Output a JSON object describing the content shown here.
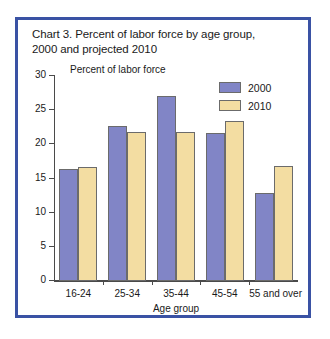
{
  "chart_data": {
    "type": "bar",
    "title": "Chart 3. Percent of labor force by age group, 2000 and projected 2010",
    "title_line1": "Chart 3. Percent of labor force by age group,",
    "title_line2": "2000 and projected 2010",
    "ylabel": "Percent of labor force",
    "xlabel": "Age group",
    "categories": [
      "16-24",
      "25-34",
      "35-44",
      "45-54",
      "55 and over"
    ],
    "series": [
      {
        "name": "2000",
        "color": "#8185c6",
        "values": [
          16.2,
          22.5,
          26.9,
          21.5,
          12.8
        ]
      },
      {
        "name": "2010",
        "color": "#f3dda2",
        "values": [
          16.5,
          21.6,
          21.6,
          23.2,
          16.7
        ]
      }
    ],
    "ylim": [
      0,
      30
    ],
    "yticks": [
      0,
      5,
      10,
      15,
      20,
      25,
      30
    ],
    "ytick_labels": [
      "0",
      "5",
      "10",
      "15",
      "20",
      "25",
      "30"
    ],
    "grid": false,
    "legend_position": "top-right",
    "frame_color": "#3a52a4",
    "axis_color": "#4a4a4a",
    "bar_border_color": "#6b6b6b"
  }
}
